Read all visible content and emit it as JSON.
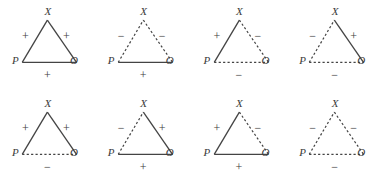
{
  "figure": {
    "name": "balance-theory-triads",
    "vertex_labels": {
      "top": "X",
      "left": "P",
      "right": "O"
    },
    "line_color": "#444444",
    "text_color": "#3b3b3b",
    "background": "#ffffff",
    "rows": 2,
    "columns": 4
  },
  "triangles": [
    {
      "id": "triad-1",
      "labels": {
        "top": "X",
        "left": "P",
        "right": "O"
      },
      "edges": {
        "px": {
          "style": "solid",
          "sign": "+"
        },
        "xo": {
          "style": "solid",
          "sign": "+"
        },
        "po": {
          "style": "solid",
          "sign": "+"
        }
      }
    },
    {
      "id": "triad-2",
      "labels": {
        "top": "X",
        "left": "P",
        "right": "O"
      },
      "edges": {
        "px": {
          "style": "dashed",
          "sign": "−"
        },
        "xo": {
          "style": "dashed",
          "sign": "−"
        },
        "po": {
          "style": "solid",
          "sign": "+"
        }
      }
    },
    {
      "id": "triad-3",
      "labels": {
        "top": "X",
        "left": "P",
        "right": "O"
      },
      "edges": {
        "px": {
          "style": "solid",
          "sign": "+"
        },
        "xo": {
          "style": "dashed",
          "sign": "−"
        },
        "po": {
          "style": "dashed",
          "sign": "−"
        }
      }
    },
    {
      "id": "triad-4",
      "labels": {
        "top": "X",
        "left": "P",
        "right": "O"
      },
      "edges": {
        "px": {
          "style": "dashed",
          "sign": "−"
        },
        "xo": {
          "style": "solid",
          "sign": "+"
        },
        "po": {
          "style": "dashed",
          "sign": "−"
        }
      }
    },
    {
      "id": "triad-5",
      "labels": {
        "top": "X",
        "left": "P",
        "right": "O"
      },
      "edges": {
        "px": {
          "style": "solid",
          "sign": "+"
        },
        "xo": {
          "style": "solid",
          "sign": "+"
        },
        "po": {
          "style": "dashed",
          "sign": "−"
        }
      }
    },
    {
      "id": "triad-6",
      "labels": {
        "top": "X",
        "left": "P",
        "right": "O"
      },
      "edges": {
        "px": {
          "style": "dashed",
          "sign": "−"
        },
        "xo": {
          "style": "solid",
          "sign": "+"
        },
        "po": {
          "style": "solid",
          "sign": "+"
        }
      }
    },
    {
      "id": "triad-7",
      "labels": {
        "top": "X",
        "left": "P",
        "right": "O"
      },
      "edges": {
        "px": {
          "style": "solid",
          "sign": "+"
        },
        "xo": {
          "style": "dashed",
          "sign": "−"
        },
        "po": {
          "style": "solid",
          "sign": "+"
        }
      }
    },
    {
      "id": "triad-8",
      "labels": {
        "top": "X",
        "left": "P",
        "right": "O"
      },
      "edges": {
        "px": {
          "style": "dashed",
          "sign": "−"
        },
        "xo": {
          "style": "dashed",
          "sign": "−"
        },
        "po": {
          "style": "dashed",
          "sign": "−"
        }
      }
    }
  ]
}
